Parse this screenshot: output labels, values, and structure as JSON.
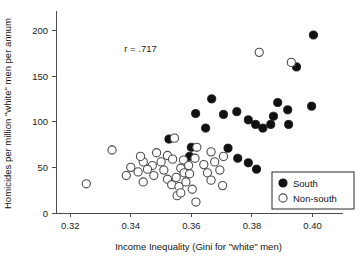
{
  "chart_data": {
    "type": "scatter",
    "title": "",
    "xlabel": "Income Inequality (Gini for \"white\" men)",
    "ylabel": "Homicides per million \"white\" men per annum",
    "xlim": [
      0.3153,
      0.4094
    ],
    "ylim": [
      0,
      218
    ],
    "xticks": [
      0.32,
      0.34,
      0.36,
      0.38,
      0.4
    ],
    "xticklabels": [
      "0.32",
      "0.34",
      "0.36",
      "0.38",
      "0.40"
    ],
    "yticks": [
      0,
      50,
      100,
      150,
      200
    ],
    "yticklabels": [
      "0",
      "50",
      "100",
      "150",
      "200"
    ],
    "grid": false,
    "annotations": [
      {
        "text": "r = .717",
        "x": 0.3432,
        "y": 176
      }
    ],
    "legend": {
      "position": "bottom-right",
      "entries": [
        {
          "label": "South",
          "marker": "filled-circle"
        },
        {
          "label": "Non-south",
          "marker": "open-circle"
        }
      ]
    },
    "series": [
      {
        "name": "South",
        "marker": "filled-circle",
        "points": [
          {
            "x": 0.3614,
            "y": 109
          },
          {
            "x": 0.3667,
            "y": 125
          },
          {
            "x": 0.3706,
            "y": 108
          },
          {
            "x": 0.3647,
            "y": 93
          },
          {
            "x": 0.3594,
            "y": 62
          },
          {
            "x": 0.36,
            "y": 72
          },
          {
            "x": 0.3721,
            "y": 71
          },
          {
            "x": 0.3753,
            "y": 60
          },
          {
            "x": 0.3788,
            "y": 102
          },
          {
            "x": 0.3812,
            "y": 97
          },
          {
            "x": 0.3836,
            "y": 93
          },
          {
            "x": 0.3862,
            "y": 97
          },
          {
            "x": 0.3871,
            "y": 106
          },
          {
            "x": 0.3885,
            "y": 121
          },
          {
            "x": 0.3918,
            "y": 113
          },
          {
            "x": 0.3947,
            "y": 160
          },
          {
            "x": 0.3997,
            "y": 117
          },
          {
            "x": 0.4003,
            "y": 195
          },
          {
            "x": 0.3788,
            "y": 55
          },
          {
            "x": 0.3815,
            "y": 48
          },
          {
            "x": 0.3921,
            "y": 97
          },
          {
            "x": 0.375,
            "y": 111
          },
          {
            "x": 0.3526,
            "y": 81
          }
        ]
      },
      {
        "name": "Non-south",
        "marker": "open-circle",
        "points": [
          {
            "x": 0.3253,
            "y": 32
          },
          {
            "x": 0.3338,
            "y": 69
          },
          {
            "x": 0.3385,
            "y": 41
          },
          {
            "x": 0.3424,
            "y": 45
          },
          {
            "x": 0.3441,
            "y": 34
          },
          {
            "x": 0.3471,
            "y": 52
          },
          {
            "x": 0.3476,
            "y": 41
          },
          {
            "x": 0.35,
            "y": 56
          },
          {
            "x": 0.3509,
            "y": 47
          },
          {
            "x": 0.3521,
            "y": 37
          },
          {
            "x": 0.3535,
            "y": 31
          },
          {
            "x": 0.355,
            "y": 39
          },
          {
            "x": 0.3559,
            "y": 29
          },
          {
            "x": 0.3565,
            "y": 49
          },
          {
            "x": 0.3576,
            "y": 44
          },
          {
            "x": 0.3582,
            "y": 34
          },
          {
            "x": 0.3594,
            "y": 43
          },
          {
            "x": 0.3603,
            "y": 26
          },
          {
            "x": 0.3615,
            "y": 12
          },
          {
            "x": 0.3553,
            "y": 19
          },
          {
            "x": 0.3565,
            "y": 22
          },
          {
            "x": 0.3485,
            "y": 66
          },
          {
            "x": 0.3521,
            "y": 63
          },
          {
            "x": 0.3538,
            "y": 59
          },
          {
            "x": 0.3574,
            "y": 58
          },
          {
            "x": 0.3591,
            "y": 52
          },
          {
            "x": 0.3612,
            "y": 60
          },
          {
            "x": 0.3641,
            "y": 53
          },
          {
            "x": 0.3653,
            "y": 44
          },
          {
            "x": 0.3665,
            "y": 36
          },
          {
            "x": 0.3677,
            "y": 56
          },
          {
            "x": 0.3694,
            "y": 47
          },
          {
            "x": 0.3706,
            "y": 62
          },
          {
            "x": 0.3618,
            "y": 72
          },
          {
            "x": 0.3665,
            "y": 67
          },
          {
            "x": 0.3441,
            "y": 56
          },
          {
            "x": 0.3455,
            "y": 48
          },
          {
            "x": 0.3703,
            "y": 30
          },
          {
            "x": 0.3824,
            "y": 176
          },
          {
            "x": 0.393,
            "y": 165
          },
          {
            "x": 0.3544,
            "y": 82
          },
          {
            "x": 0.3432,
            "y": 62
          },
          {
            "x": 0.34,
            "y": 50
          }
        ]
      }
    ]
  }
}
